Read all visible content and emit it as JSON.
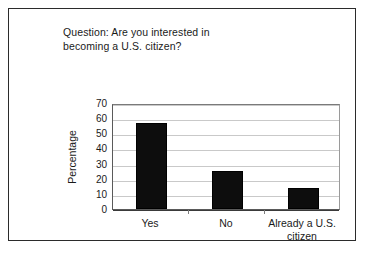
{
  "chart_data": {
    "type": "bar",
    "title": "Question: Are you interested in\nbecoming a U.S. citizen?",
    "xlabel": "",
    "ylabel": "Percentage",
    "categories": [
      "Yes",
      "No",
      "Already a U.S.\ncitizen"
    ],
    "values": [
      57,
      25,
      14
    ],
    "ylim": [
      0,
      70
    ],
    "yticks": [
      70,
      60,
      50,
      40,
      30,
      20,
      10,
      0
    ],
    "grid": true,
    "legend": false,
    "bar_color": "#0d0d0d",
    "gridline_color": "#c9c9c9",
    "axis_color": "#3a3a3a",
    "background": "#ffffff"
  },
  "figure": {
    "border_color": "#2b2b2b"
  }
}
